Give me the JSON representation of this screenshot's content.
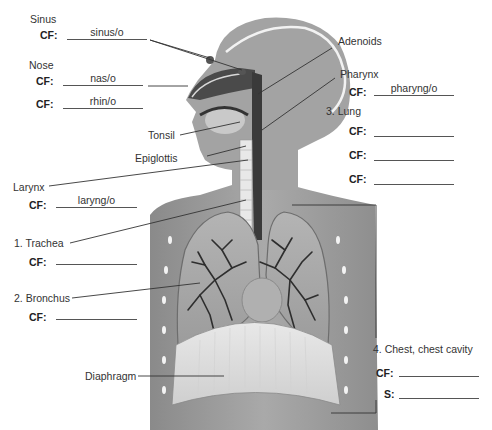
{
  "diagram": {
    "line_color": "#333333",
    "figure_colors": {
      "skin": "#9a9a9a",
      "skin_light": "#bdbdbd",
      "lung": "#a8a8a8",
      "bronchi": "#2e2e2e",
      "trachea": "#e6e6e6"
    }
  },
  "labels": {
    "sinus": {
      "name": "Sinus",
      "cf_label": "CF:",
      "cf_value": "sinus/o"
    },
    "nose": {
      "name": "Nose",
      "cf_label": "CF:",
      "cf_values": [
        "nas/o",
        "rhin/o"
      ]
    },
    "adenoids": {
      "name": "Adenoids"
    },
    "pharynx": {
      "name": "Pharynx",
      "cf_label": "CF:",
      "cf_value": "pharyng/o"
    },
    "tonsil": {
      "name": "Tonsil"
    },
    "epiglottis": {
      "name": "Epiglottis"
    },
    "larynx": {
      "name": "Larynx",
      "cf_label": "CF:",
      "cf_value": "laryng/o"
    },
    "trachea": {
      "name": "1. Trachea",
      "cf_label": "CF:",
      "cf_value": ""
    },
    "bronchus": {
      "name": "2. Bronchus",
      "cf_label": "CF:",
      "cf_value": ""
    },
    "lung": {
      "name": "3. Lung",
      "cf_label": "CF:",
      "cf_values": [
        "",
        "",
        ""
      ]
    },
    "chest": {
      "name": "4. Chest, chest cavity",
      "cf_label": "CF:",
      "cf_value": "",
      "s_label": "S:",
      "s_value": ""
    },
    "diaphragm": {
      "name": "Diaphragm"
    }
  }
}
